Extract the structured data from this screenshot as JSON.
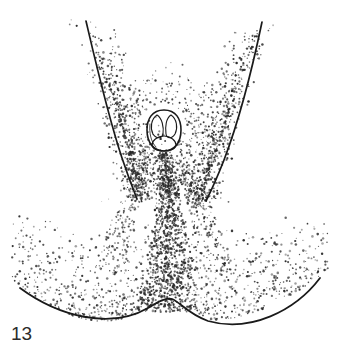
{
  "figure": {
    "label": "13",
    "caption_text": "13",
    "width": 341,
    "height": 360,
    "background_color": "#ffffff",
    "ink_color": "#1a1a1a",
    "stipple_color": "#2a2a2a",
    "medium": "line-and-stipple scientific illustration"
  },
  "chart_data": {
    "type": "diagram",
    "title": "13",
    "elements": [
      {
        "name": "left-ridge-line",
        "kind": "curve",
        "start": [
          86,
          21
        ],
        "end": [
          137,
          198
        ],
        "control_points": [
          [
            99,
            80
          ],
          [
            115,
            140
          ]
        ],
        "stroke_width": 1.6
      },
      {
        "name": "right-ridge-line",
        "kind": "curve",
        "start": [
          262,
          22
        ],
        "end": [
          206,
          200
        ],
        "control_points": [
          [
            248,
            80
          ],
          [
            228,
            142
          ]
        ],
        "stroke_width": 1.6
      },
      {
        "name": "bottom-margin-curve",
        "kind": "curve",
        "start": [
          20,
          288
        ],
        "end": [
          320,
          278
        ],
        "control_points": [
          [
            80,
            330
          ],
          [
            140,
            318
          ],
          [
            172,
            300
          ],
          [
            210,
            322
          ],
          [
            270,
            312
          ]
        ],
        "stroke_width": 1.8
      },
      {
        "name": "central-organ",
        "kind": "ovate-outline",
        "center": [
          164,
          130
        ],
        "radius_x": 16,
        "radius_y": 20,
        "lobes": 3,
        "stroke_width": 1.5
      },
      {
        "name": "central-stipple-band",
        "kind": "stipple-band",
        "top": [
          164,
          152
        ],
        "bottom": [
          168,
          310
        ],
        "density": "high"
      },
      {
        "name": "left-stipple-field",
        "kind": "stipple-field",
        "density": "medium"
      },
      {
        "name": "right-stipple-field",
        "kind": "stipple-field",
        "density": "medium"
      },
      {
        "name": "basal-stipple-field",
        "kind": "stipple-field",
        "density": "graded"
      }
    ],
    "axis": {
      "visible": false
    },
    "legend": {
      "visible": false
    },
    "grid": false
  }
}
